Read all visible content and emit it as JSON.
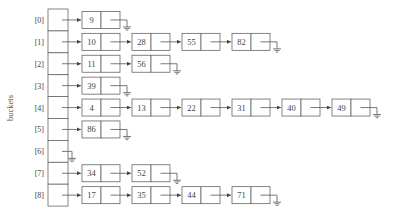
{
  "diagram": {
    "axis_label": "buckets",
    "bucket_count": 9,
    "buckets": [
      {
        "index_label": "[0]",
        "chain": [
          9
        ]
      },
      {
        "index_label": "[1]",
        "chain": [
          10,
          28,
          55,
          82
        ]
      },
      {
        "index_label": "[2]",
        "chain": [
          11,
          56
        ]
      },
      {
        "index_label": "[3]",
        "chain": [
          39
        ]
      },
      {
        "index_label": "[4]",
        "chain": [
          4,
          13,
          22,
          31,
          40,
          49
        ]
      },
      {
        "index_label": "[5]",
        "chain": [
          86
        ]
      },
      {
        "index_label": "[6]",
        "chain": []
      },
      {
        "index_label": "[7]",
        "chain": [
          34,
          52
        ]
      },
      {
        "index_label": "[8]",
        "chain": [
          17,
          35,
          44,
          71
        ]
      }
    ],
    "null_symbol": "ground-icon",
    "colors": {
      "stroke": "#666666",
      "text": "#444444",
      "background": "#ffffff"
    }
  }
}
